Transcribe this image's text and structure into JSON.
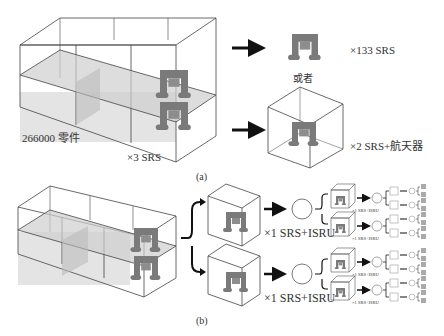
{
  "panel_a": {
    "caption": "(a)",
    "big_box_label": "266000 零件",
    "big_box_multiplier": "×3 SRS",
    "top_result_label": "×133 SRS",
    "or_label": "或者",
    "bottom_result_label": "×2 SRS+航天器"
  },
  "panel_b": {
    "caption": "(b)",
    "branch_label_1": "×1 SRS+ISRU",
    "branch_label_2": "×1 SRS+ISRU",
    "small_label": "×1 SRS+ISRU",
    "tiny_label": "×1 SRS+SRS"
  },
  "colors": {
    "line": "#444444",
    "fill": "#d6d6d6",
    "robot": "#7a7a7a",
    "arrow": "#111111"
  }
}
